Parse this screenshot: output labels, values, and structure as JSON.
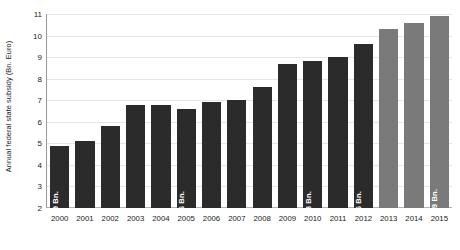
{
  "chart_data": {
    "type": "bar",
    "title": "",
    "xlabel": "",
    "ylabel": "Annual federal state subsidy (Bn. Euro)",
    "ylim": [
      2,
      11
    ],
    "yticks": [
      2,
      3,
      4,
      5,
      6,
      7,
      8,
      9,
      10,
      11
    ],
    "ytick_labels": [
      "2",
      "3",
      "4",
      "5",
      "6",
      "7",
      "8",
      "9",
      "10",
      "11"
    ],
    "grid": true,
    "legend": "none",
    "categories": [
      "2000",
      "2001",
      "2002",
      "2003",
      "2004",
      "2005",
      "2006",
      "2007",
      "2008",
      "2009",
      "2010",
      "2011",
      "2012",
      "2013",
      "2014",
      "2015"
    ],
    "values": [
      4.9,
      5.1,
      5.8,
      6.8,
      6.8,
      6.6,
      6.9,
      7.0,
      7.6,
      8.7,
      8.8,
      9.0,
      9.6,
      10.3,
      10.6,
      10.9
    ],
    "bar_labels": [
      "4.9 Bn.",
      "",
      "",
      "",
      "",
      "6.6 Bn.",
      "",
      "",
      "",
      "",
      "8.8 Bn.",
      "",
      "9.6 Bn.",
      "",
      "",
      "10.9 Bn."
    ],
    "bar_colors": [
      "#2b2b2b",
      "#2b2b2b",
      "#2b2b2b",
      "#2b2b2b",
      "#2b2b2b",
      "#2b2b2b",
      "#2b2b2b",
      "#2b2b2b",
      "#2b2b2b",
      "#2b2b2b",
      "#2b2b2b",
      "#2b2b2b",
      "#2b2b2b",
      "#7a7a7a",
      "#7a7a7a",
      "#7a7a7a"
    ],
    "colors": {
      "bar_actual": "#2b2b2b",
      "bar_projected": "#7a7a7a",
      "gridline": "#e6e6e6",
      "axis": "#9a9a9a",
      "label_text": "#ffffff",
      "tick_text": "#1a1a1a",
      "background": "#ffffff"
    }
  }
}
